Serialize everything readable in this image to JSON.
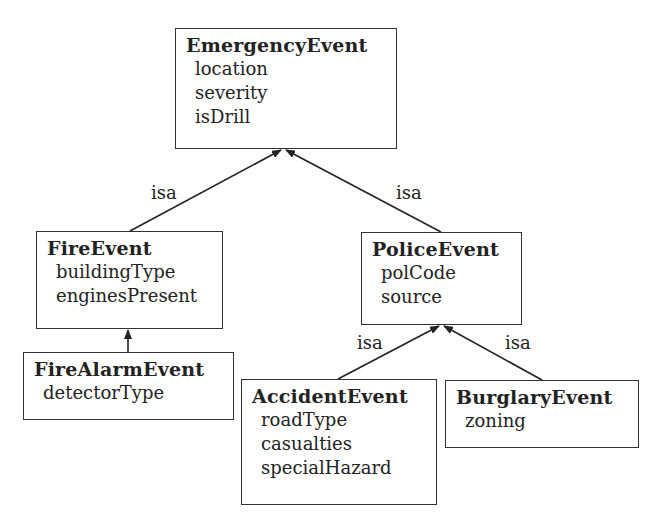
{
  "classes": {
    "emergency": {
      "name": "EmergencyEvent",
      "attrs": [
        "location",
        "severity",
        "isDrill"
      ]
    },
    "fire": {
      "name": "FireEvent",
      "attrs": [
        "buildingType",
        "enginesPresent"
      ]
    },
    "firealarm": {
      "name": "FireAlarmEvent",
      "attrs": [
        "detectorType"
      ]
    },
    "police": {
      "name": "PoliceEvent",
      "attrs": [
        "polCode",
        "source"
      ]
    },
    "accident": {
      "name": "AccidentEvent",
      "attrs": [
        "roadType",
        "casualties",
        "specialHazard"
      ]
    },
    "burglary": {
      "name": "BurglaryEvent",
      "attrs": [
        "zoning"
      ]
    }
  },
  "edges": [
    {
      "from": "FireEvent",
      "to": "EmergencyEvent",
      "label": "isa"
    },
    {
      "from": "PoliceEvent",
      "to": "EmergencyEvent",
      "label": "isa"
    },
    {
      "from": "FireAlarmEvent",
      "to": "FireEvent",
      "label": ""
    },
    {
      "from": "AccidentEvent",
      "to": "PoliceEvent",
      "label": "isa"
    },
    {
      "from": "BurglaryEvent",
      "to": "PoliceEvent",
      "label": "isa"
    }
  ]
}
